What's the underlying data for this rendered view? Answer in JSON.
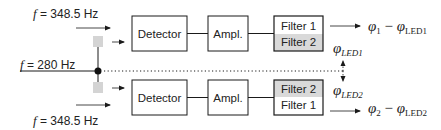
{
  "inputs": {
    "top_freq_label": "f = 348.5 Hz",
    "middle_freq_label": "f = 280 Hz",
    "bottom_freq_label": "f = 348.5 Hz",
    "f_symbol": "f",
    "top_value": " = 348.5 Hz",
    "middle_value": " = 280 Hz",
    "bottom_value": " = 348.5 Hz"
  },
  "top_chain": {
    "detector": "Detector",
    "amplifier": "Ampl.",
    "filter_upper": "Filter 1",
    "filter_lower": "Filter 2",
    "output": {
      "phi": "φ",
      "sub1": "1",
      "minus": " − ",
      "phi2": "φ",
      "sub2": "LED1"
    }
  },
  "bottom_chain": {
    "detector": "Detector",
    "amplifier": "Ampl.",
    "filter_upper": "Filter 2",
    "filter_lower": "Filter 1",
    "output": {
      "phi": "φ",
      "sub1": "2",
      "minus": " − ",
      "phi2": "φ",
      "sub2": "LED2"
    }
  },
  "reference": {
    "led1_phi": "φ",
    "led1_sub": "LED1",
    "led2_phi": "φ",
    "led2_sub": "LED2"
  },
  "colors": {
    "line": "#1a1a1a",
    "highlight_fill": "#d9d9d9",
    "led_square": "#d4d4d4"
  }
}
